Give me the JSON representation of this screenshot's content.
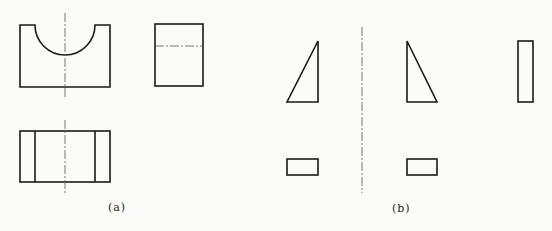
{
  "figure": {
    "panels": [
      {
        "label": "(a)",
        "views": [
          "front-view-with-semicircular-cutout",
          "side-view",
          "top-view"
        ]
      },
      {
        "label": "(b)",
        "views": [
          "left-triangle",
          "right-triangle",
          "tall-rectangle",
          "small-rectangle-left",
          "small-rectangle-right"
        ]
      }
    ],
    "colors": {
      "line": "#1a1a1a",
      "centerline": "#555555",
      "background": "#fbfbfa"
    }
  }
}
